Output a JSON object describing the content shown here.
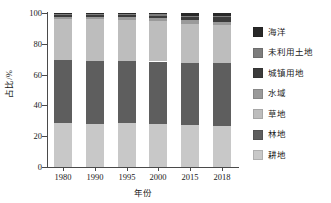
{
  "chart_data": {
    "type": "bar",
    "stacked": true,
    "title": "",
    "xlabel": "年份",
    "ylabel": "占比/%",
    "ylim": [
      0,
      100
    ],
    "yticks": [
      0,
      20,
      40,
      60,
      80,
      100
    ],
    "ytick_labels": [
      "0",
      "20",
      "40",
      "60",
      "80",
      "100"
    ],
    "grid": false,
    "legend_position": "right",
    "categories": [
      "1980",
      "1990",
      "1995",
      "2000",
      "2015",
      "2018"
    ],
    "series": [
      {
        "name": "耕地",
        "color": "#c8c8c8",
        "values": [
          28.4,
          28.0,
          28.3,
          27.8,
          27.0,
          26.5
        ]
      },
      {
        "name": "林地",
        "color": "#5e5e5e",
        "values": [
          40.9,
          41.0,
          40.7,
          40.7,
          40.3,
          41.0
        ]
      },
      {
        "name": "草地",
        "color": "#bdbdbd",
        "values": [
          26.8,
          26.8,
          26.6,
          26.5,
          25.8,
          24.5
        ]
      },
      {
        "name": "水域",
        "color": "#9a9a9a",
        "values": [
          1.5,
          1.6,
          1.7,
          1.8,
          2.2,
          2.4
        ]
      },
      {
        "name": "城镇用地",
        "color": "#3c3c3c",
        "values": [
          0.8,
          1.0,
          1.1,
          1.5,
          2.6,
          3.2
        ]
      },
      {
        "name": "未利用土地",
        "color": "#7d7d7d",
        "values": [
          0.9,
          0.9,
          0.9,
          0.9,
          0.3,
          0.6
        ]
      },
      {
        "name": "海洋",
        "color": "#282828",
        "values": [
          0.7,
          0.7,
          0.7,
          0.8,
          1.8,
          1.8
        ]
      }
    ],
    "legend_entries": [
      {
        "label": "海洋",
        "color": "#282828"
      },
      {
        "label": "未利用土地",
        "color": "#7d7d7d"
      },
      {
        "label": "城镇用地",
        "color": "#3c3c3c"
      },
      {
        "label": "水域",
        "color": "#9a9a9a"
      },
      {
        "label": "草地",
        "color": "#bdbdbd"
      },
      {
        "label": "林地",
        "color": "#5e5e5e"
      },
      {
        "label": "耕地",
        "color": "#c8c8c8"
      }
    ]
  }
}
